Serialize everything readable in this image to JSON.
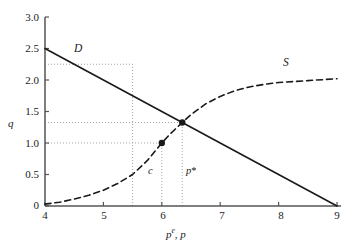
{
  "chart_data": {
    "type": "line",
    "title": "",
    "xlabel": "p^e, p",
    "ylabel": "q",
    "xlim": [
      4,
      9
    ],
    "ylim": [
      0,
      3.0
    ],
    "grid": false,
    "legend": "inline-curve-labels",
    "x_ticks": [
      "4",
      "5",
      "6",
      "7",
      "8",
      "9"
    ],
    "x_tick_values": [
      4,
      5,
      6,
      7,
      8,
      9
    ],
    "y_ticks": [
      "0",
      "0.5",
      "1.0",
      "1.5",
      "2.0",
      "2.5",
      "3.0"
    ],
    "y_tick_values": [
      0,
      0.5,
      1.0,
      1.5,
      2.0,
      2.5,
      3.0
    ],
    "series": [
      {
        "name": "D",
        "label": "D",
        "style": "solid",
        "color": "#1a1a1a",
        "description": "Demand curve, straight line from (4, 2.5) to (9, 0)",
        "points": [
          {
            "x": 4.0,
            "y": 2.5
          },
          {
            "x": 5.0,
            "y": 2.0
          },
          {
            "x": 5.5,
            "y": 1.75
          },
          {
            "x": 6.0,
            "y": 1.5
          },
          {
            "x": 6.35,
            "y": 1.325
          },
          {
            "x": 7.0,
            "y": 1.0
          },
          {
            "x": 8.0,
            "y": 0.5
          },
          {
            "x": 9.0,
            "y": 0.0
          }
        ]
      },
      {
        "name": "S",
        "label": "S",
        "style": "dashed",
        "color": "#1a1a1a",
        "description": "Supply curve, increasing S-shaped curve asymptoting to q = 2.0",
        "points": [
          {
            "x": 4.0,
            "y": 0.03
          },
          {
            "x": 4.25,
            "y": 0.06
          },
          {
            "x": 4.5,
            "y": 0.11
          },
          {
            "x": 4.75,
            "y": 0.17
          },
          {
            "x": 5.0,
            "y": 0.25
          },
          {
            "x": 5.25,
            "y": 0.36
          },
          {
            "x": 5.5,
            "y": 0.5
          },
          {
            "x": 5.75,
            "y": 0.72
          },
          {
            "x": 6.0,
            "y": 1.0
          },
          {
            "x": 6.15,
            "y": 1.15
          },
          {
            "x": 6.35,
            "y": 1.325
          },
          {
            "x": 6.5,
            "y": 1.45
          },
          {
            "x": 6.75,
            "y": 1.62
          },
          {
            "x": 7.0,
            "y": 1.74
          },
          {
            "x": 7.25,
            "y": 1.83
          },
          {
            "x": 7.5,
            "y": 1.89
          },
          {
            "x": 7.75,
            "y": 1.93
          },
          {
            "x": 8.0,
            "y": 1.96
          },
          {
            "x": 8.5,
            "y": 1.99
          },
          {
            "x": 9.0,
            "y": 2.02
          }
        ]
      }
    ],
    "markers": [
      {
        "name": "c",
        "label": "c",
        "x": 6.0,
        "y": 1.0,
        "label_x": 5.85,
        "label_y": 0.56
      },
      {
        "name": "p-star",
        "label": "p*",
        "x": 6.35,
        "y": 1.325,
        "label_x": 6.32,
        "label_y": 0.56
      }
    ],
    "guide_lines": [
      {
        "type": "vertical",
        "x": 5.5,
        "y_from": 0.0,
        "y_to": 2.25
      },
      {
        "type": "horizontal",
        "y": 2.25,
        "x_from": 4.0,
        "x_to": 5.5
      },
      {
        "type": "vertical",
        "x": 6.0,
        "y_from": 0.0,
        "y_to": 1.0
      },
      {
        "type": "horizontal",
        "y": 1.0,
        "x_from": 4.0,
        "x_to": 6.0
      },
      {
        "type": "vertical",
        "x": 6.35,
        "y_from": 0.0,
        "y_to": 1.325
      },
      {
        "type": "horizontal",
        "y": 1.325,
        "x_from": 4.0,
        "x_to": 6.35
      }
    ],
    "annotations": [
      {
        "name": "demand-label",
        "text": "D",
        "x": 4.9,
        "y": 2.35
      },
      {
        "name": "supply-label",
        "text": "S",
        "x": 8.0,
        "y": 2.25
      }
    ]
  },
  "axis": {
    "y_title": "q",
    "x_title_base": "p",
    "x_title_sup": "e",
    "x_title_rest": ", p"
  },
  "colors": {
    "curve": "#1a1a1a",
    "axis": "#555555",
    "guide": "#9a9a9a",
    "background": "#ffffff"
  }
}
